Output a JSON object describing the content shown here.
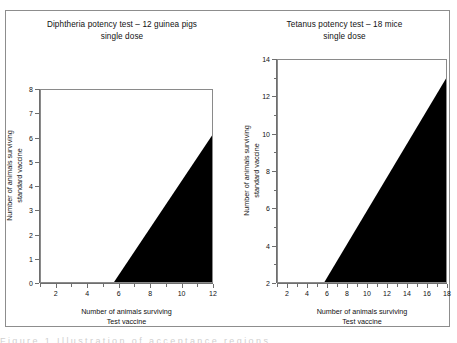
{
  "figure": {
    "background": "#ffffff",
    "border_color": "#8d8d8d",
    "fill_color": "#000000",
    "axis_color": "#6e6e6e",
    "bottom_text": "Figure 1 Illustration of acceptance regions"
  },
  "chart_data": [
    {
      "type": "area",
      "title": "Diphtheria potency test – 12 guinea pigs\nsingle dose",
      "title_line1": "Diphtheria potency test – 12 guinea pigs",
      "title_line2": "single dose",
      "xlabel_line1": "Number of animals surviving",
      "xlabel_line2": "Test vaccine",
      "ylabel_line1": "Number of animals surviving",
      "ylabel_line2": "standard vaccine",
      "xlim": [
        1,
        12
      ],
      "ylim": [
        0,
        8
      ],
      "xticks": [
        2,
        4,
        6,
        8,
        10,
        12
      ],
      "xticks_minor": [
        1,
        3,
        5,
        7,
        9,
        11
      ],
      "yticks": [
        0,
        1,
        2,
        3,
        4,
        5,
        6,
        7,
        8
      ],
      "grid": false,
      "legend": "none",
      "series": [
        {
          "name": "acceptance region",
          "boundary_x": [
            5.7,
            12
          ],
          "boundary_y": [
            0,
            6.1
          ],
          "fill": "#000000",
          "description": "Shaded acceptance region bounded below by y=0, on the right by x=12, and on the upper-left by a straight line from (5.7, 0) to (12, 6.1)"
        }
      ]
    },
    {
      "type": "area",
      "title": "Tetanus potency test – 18 mice\nsingle dose",
      "title_line1": "Tetanus potency test – 18 mice",
      "title_line2": "single dose",
      "xlabel_line1": "Number of animals surviving",
      "xlabel_line2": "Test vaccine",
      "ylabel_line1": "Number of animals surviving",
      "ylabel_line2": "standard vaccine",
      "xlim": [
        1,
        18
      ],
      "ylim": [
        2,
        14
      ],
      "xticks": [
        2,
        4,
        6,
        8,
        10,
        12,
        14,
        16,
        18
      ],
      "xticks_minor": [
        1,
        3,
        5,
        7,
        9,
        11,
        13,
        15,
        17
      ],
      "yticks": [
        2,
        4,
        6,
        8,
        10,
        12,
        14
      ],
      "yticks_minor": [
        3,
        5,
        7,
        9,
        11,
        13
      ],
      "grid": false,
      "legend": "none",
      "series": [
        {
          "name": "acceptance region",
          "boundary_x": [
            5.7,
            18
          ],
          "boundary_y": [
            2,
            13.0
          ],
          "fill": "#000000",
          "description": "Shaded acceptance region bounded below by y=2, on the right by x=18, and on the upper-left by a straight line from (5.7, 2) to (18, 13.0)"
        }
      ]
    }
  ]
}
